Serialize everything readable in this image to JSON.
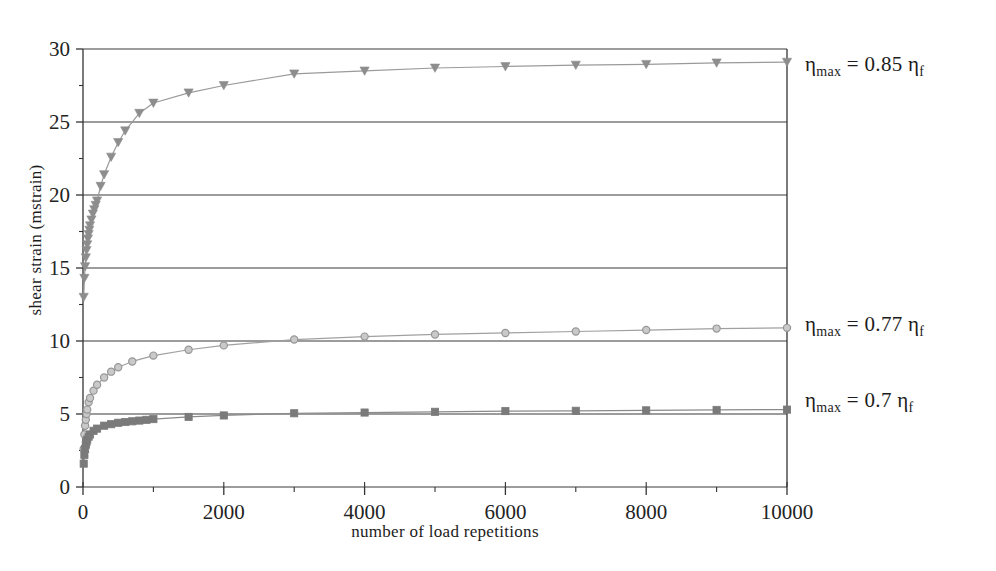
{
  "chart_data": {
    "type": "line",
    "title": "",
    "subtitle": "",
    "xlabel": "number of load repetitions",
    "ylabel": "shear strain (mstrain)",
    "xlim": [
      0,
      10000
    ],
    "ylim": [
      0,
      30
    ],
    "xticks": [
      0,
      2000,
      4000,
      6000,
      8000,
      10000
    ],
    "xticklabels": [
      "0",
      "2000",
      "4000",
      "6000",
      "8000",
      "10000"
    ],
    "yticks": [
      0,
      5,
      10,
      15,
      20,
      25,
      30
    ],
    "yticklabels": [
      "0",
      "5",
      "10",
      "15",
      "20",
      "25",
      "30"
    ],
    "x_minor_interval": 1000,
    "y_minor_interval": 2.5,
    "grid": "horizontal",
    "legend_position": "right-of-axes-inline",
    "series": [
      {
        "name": "eta_max = 0.85 eta_f",
        "label_text": "ηmax = 0.85 ηf",
        "label_base": "η",
        "label_sub1": "max",
        "label_mid": " = 0.85 ",
        "label_base2": "η",
        "label_sub2": "f",
        "marker": "triangle-down",
        "color": "#8d8d8d",
        "line_color": "#9a9a9a",
        "annotation_y_value": 29.0,
        "x": [
          10,
          20,
          30,
          40,
          50,
          60,
          70,
          80,
          90,
          100,
          120,
          140,
          160,
          180,
          200,
          250,
          300,
          400,
          500,
          600,
          800,
          1000,
          1500,
          2000,
          3000,
          4000,
          5000,
          6000,
          7000,
          8000,
          9000,
          10000
        ],
        "y": [
          13.0,
          14.3,
          15.1,
          15.7,
          16.2,
          16.6,
          17.0,
          17.3,
          17.6,
          17.9,
          18.3,
          18.7,
          19.0,
          19.3,
          19.6,
          20.6,
          21.4,
          22.6,
          23.6,
          24.4,
          25.6,
          26.3,
          27.0,
          27.5,
          28.3,
          28.5,
          28.7,
          28.8,
          28.9,
          28.95,
          29.05,
          29.1
        ]
      },
      {
        "name": "eta_max = 0.77 eta_f",
        "label_text": "ηmax = 0.77 ηf",
        "label_base": "η",
        "label_sub1": "max",
        "label_mid": " = 0.77 ",
        "label_base2": "η",
        "label_sub2": "f",
        "marker": "circle",
        "color": "#969696",
        "line_color": "#a0a0a0",
        "annotation_y_value": 10.9,
        "x": [
          10,
          20,
          30,
          40,
          50,
          60,
          80,
          100,
          150,
          200,
          300,
          400,
          500,
          700,
          1000,
          1500,
          2000,
          3000,
          4000,
          5000,
          6000,
          7000,
          8000,
          9000,
          10000
        ],
        "y": [
          2.6,
          3.6,
          4.2,
          4.6,
          5.0,
          5.3,
          5.8,
          6.1,
          6.6,
          7.0,
          7.5,
          7.9,
          8.2,
          8.6,
          9.0,
          9.4,
          9.7,
          10.1,
          10.3,
          10.45,
          10.55,
          10.65,
          10.75,
          10.85,
          10.9
        ]
      },
      {
        "name": "eta_max = 0.7 eta_f",
        "label_text": "ηmax = 0.7 ηf",
        "label_base": "η",
        "label_sub1": "max",
        "label_mid": " = 0.7 ",
        "label_base2": "η",
        "label_sub2": "f",
        "marker": "square",
        "color": "#7a7a7a",
        "line_color": "#8a8a8a",
        "annotation_y_value": 5.3,
        "x": [
          10,
          20,
          30,
          40,
          50,
          60,
          80,
          100,
          150,
          200,
          300,
          400,
          500,
          600,
          700,
          800,
          900,
          1000,
          1500,
          2000,
          3000,
          4000,
          5000,
          6000,
          7000,
          8000,
          9000,
          10000
        ],
        "y": [
          1.6,
          2.2,
          2.6,
          2.9,
          3.1,
          3.25,
          3.45,
          3.6,
          3.85,
          4.0,
          4.2,
          4.3,
          4.4,
          4.45,
          4.5,
          4.55,
          4.6,
          4.65,
          4.8,
          4.9,
          5.05,
          5.1,
          5.15,
          5.2,
          5.22,
          5.25,
          5.28,
          5.3
        ]
      }
    ]
  },
  "axes": {
    "y_axis_title": "shear strain (mstrain)",
    "x_axis_title": "number of load repetitions"
  },
  "annotations": {
    "top": {
      "eta": "η",
      "sub_max": "max",
      "equals_value": " = 0.85 ",
      "eta2": "η",
      "sub_f": "f"
    },
    "middle": {
      "eta": "η",
      "sub_max": "max",
      "equals_value": " = 0.77 ",
      "eta2": "η",
      "sub_f": "f"
    },
    "bottom": {
      "eta": "η",
      "sub_max": "max",
      "equals_value": " = 0.7 ",
      "eta2": "η",
      "sub_f": "f"
    }
  },
  "style": {
    "axis_color": "#333333",
    "grid_color": "#3a3a3a",
    "background": "#ffffff"
  }
}
